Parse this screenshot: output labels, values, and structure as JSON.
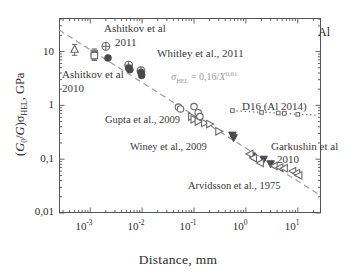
{
  "figure": {
    "material_label": "Al",
    "xlabel": "Distance, mm",
    "ylabel_prefix": "(",
    "ylabel": "(G0/G)σHEL, GPa"
  },
  "axes": {
    "x_ticks": [
      "10−3",
      "10−2",
      "10−1",
      "10⁰",
      "10¹"
    ],
    "x_tick_exponents": [
      "-3",
      "-2",
      "-1",
      "0",
      "1"
    ],
    "y_ticks": [
      "10",
      "1",
      "0,1",
      "0,01"
    ],
    "x_range_decades": [
      -3.6,
      1.45
    ],
    "y_range_decades": [
      -2,
      1.62
    ]
  },
  "annotations": {
    "ashitkov_2011": "Ashitkov et al",
    "ashitkov_2011_year": "2011",
    "whitley": "Whitley et al., 2011",
    "ashitkov_2010": "Ashitkov et al",
    "ashitkov_2010_year": "2010",
    "equation": "σHEL = 0,16/X 0,61",
    "equation_lhs": "σ",
    "equation_sub": "HEL",
    "equation_mid": " = 0,16/",
    "equation_var": "X",
    "equation_exp": "0,61",
    "gupta": "Gupta et al., 2009",
    "winey": "Winey et al., 2009",
    "d16": "D16 (Al 2014)",
    "garkushin": "Garkushin et al",
    "garkushin_year": "2010",
    "arvidsson": "Arvidsson et al., 1975"
  },
  "colors": {
    "frame": "#555555",
    "text": "#2b2b2b",
    "annotation": "#3a3a3a",
    "equation": "#9a9a9a",
    "dashed_fit": "#9c9c9c",
    "dotted_d16": "#6f6f6f",
    "open_marker_stroke": "#6a6a6a",
    "filled_marker": "#4a4a4a"
  },
  "chart_data": {
    "type": "scatter",
    "title": "",
    "xlabel": "Distance, mm",
    "ylabel": "(G0/G)σHEL, GPa",
    "xscale": "log",
    "yscale": "log",
    "xlim": [
      0.00025,
      28
    ],
    "ylim": [
      0.01,
      42
    ],
    "grid": false,
    "legend": "in-plot annotations",
    "fit_curve": {
      "label": "σHEL = 0,16/X^0,61",
      "coefficient": 0.16,
      "exponent": -0.61,
      "style": "dashed",
      "color": "#9c9c9c"
    },
    "d16_curve": {
      "label": "D16 (Al 2014)",
      "style": "dotted",
      "marker": "open-square",
      "x": [
        0.55,
        2.0,
        4.2,
        5.5,
        10.0
      ],
      "y": [
        0.8,
        0.74,
        0.72,
        0.71,
        0.68
      ]
    },
    "series": [
      {
        "name": "Ashitkov et al 2010",
        "marker": "open-triangle-up-errorbar",
        "x": [
          0.0005
        ],
        "y": [
          11.0
        ],
        "yerr": [
          2.5
        ]
      },
      {
        "name": "Ashitkov et al 2011",
        "marker": "open-square-errorbar",
        "x": [
          0.0012,
          0.0012
        ],
        "y": [
          9.2,
          8.4
        ],
        "yerr": [
          2.0,
          1.6
        ]
      },
      {
        "name": "Whitley et al., 2011",
        "marker": "circle-plus",
        "x": [
          0.002,
          0.0055,
          0.0095
        ],
        "y": [
          12.5,
          5.6,
          4.4
        ]
      },
      {
        "name": "Filled circles (laser shock)",
        "marker": "filled-circle",
        "x": [
          0.0022,
          0.0055,
          0.0058,
          0.0095,
          0.0098
        ],
        "y": [
          7.6,
          4.9,
          4.6,
          4.1,
          3.6
        ]
      },
      {
        "name": "Gupta et al., 2009",
        "marker": "open-circle",
        "x": [
          0.05,
          0.055,
          0.1,
          0.12,
          0.13
        ],
        "y": [
          0.93,
          0.86,
          0.95,
          0.73,
          0.62
        ]
      },
      {
        "name": "Winey et al., 2009",
        "marker": "open-triangle-right",
        "x": [
          0.09,
          0.1,
          0.12,
          0.16,
          0.2,
          0.3
        ],
        "y": [
          0.62,
          0.55,
          0.5,
          0.47,
          0.45,
          0.33
        ]
      },
      {
        "name": "Garkushin et al 2010",
        "marker": "filled-triangle",
        "x": [
          0.55,
          0.58,
          1.3,
          2.2,
          3.0
        ],
        "y": [
          0.28,
          0.25,
          0.115,
          0.1,
          0.082
        ]
      },
      {
        "name": "Arvidsson et al., 1975",
        "marker": "open-triangle-left",
        "x": [
          1.2,
          1.4,
          1.9,
          3.5,
          4.5,
          5.5,
          8.0,
          9.5,
          10.5
        ],
        "y": [
          0.125,
          0.105,
          0.085,
          0.075,
          0.07,
          0.068,
          0.06,
          0.055,
          0.05
        ]
      }
    ]
  }
}
